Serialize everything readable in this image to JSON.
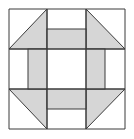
{
  "diagram": {
    "type": "quilt-block",
    "pattern": "churn-dash",
    "colors": {
      "background": "#ffffff",
      "fill": "#d6d6d6",
      "stroke": "#3a3a3a"
    },
    "grid": {
      "x": [
        9,
        47,
        86,
        125
      ],
      "y": [
        9,
        49,
        89,
        129
      ]
    },
    "shaded_triangles": [
      {
        "name": "top-left",
        "points": "9,49 47,9 47,49"
      },
      {
        "name": "top-right",
        "points": "86,9 125,49 86,49"
      },
      {
        "name": "bottom-left",
        "points": "9,89 47,89 47,129"
      },
      {
        "name": "bottom-right",
        "points": "86,89 125,89 86,129"
      }
    ],
    "shaded_bars": [
      {
        "name": "top",
        "x": 47,
        "y": 29,
        "w": 39,
        "h": 20
      },
      {
        "name": "left",
        "x": 28,
        "y": 49,
        "w": 19,
        "h": 40
      },
      {
        "name": "right",
        "x": 86,
        "y": 49,
        "w": 19,
        "h": 40
      },
      {
        "name": "bottom",
        "x": 47,
        "y": 89,
        "w": 39,
        "h": 20
      }
    ]
  }
}
